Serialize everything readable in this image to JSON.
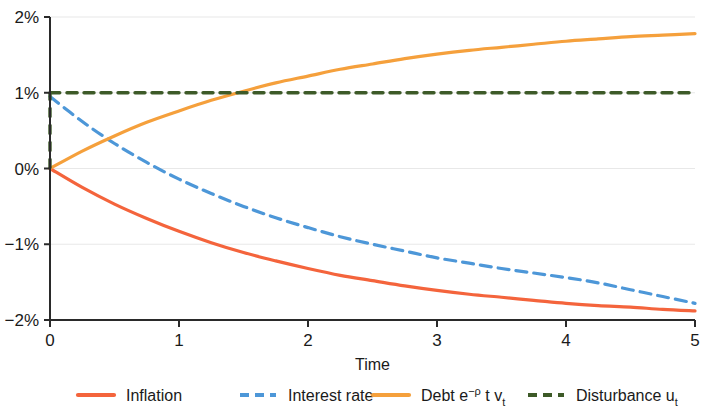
{
  "chart_data": {
    "type": "line",
    "title": "",
    "xlabel": "Time",
    "ylabel": "",
    "xlim": [
      0,
      5
    ],
    "ylim": [
      -2,
      2
    ],
    "grid": true,
    "legend_position": "bottom",
    "x_ticks": [
      "0",
      "1",
      "2",
      "3",
      "4",
      "5"
    ],
    "x_tick_values": [
      0,
      1,
      2,
      3,
      4,
      5
    ],
    "y_ticks": [
      "2%",
      "1%",
      "0%",
      "−1%",
      "−2%"
    ],
    "y_tick_values": [
      2,
      1,
      0,
      -1,
      -2
    ],
    "x": [
      0,
      0.25,
      0.5,
      0.75,
      1,
      1.25,
      1.5,
      1.75,
      2,
      2.25,
      2.5,
      2.75,
      3,
      3.25,
      3.5,
      3.75,
      4,
      4.25,
      4.5,
      4.75,
      5
    ],
    "series": [
      {
        "name": "Inflation",
        "label": "Inflation",
        "color": "#F4643C",
        "style": "solid",
        "width": 3.2,
        "values": [
          0.0,
          -0.25,
          -0.47,
          -0.66,
          -0.83,
          -0.98,
          -1.11,
          -1.22,
          -1.32,
          -1.41,
          -1.48,
          -1.55,
          -1.61,
          -1.66,
          -1.7,
          -1.74,
          -1.78,
          -1.81,
          -1.83,
          -1.86,
          -1.88
        ]
      },
      {
        "name": "Interest rate",
        "label": "Interest rate",
        "color": "#4D97D8",
        "style": "dashed",
        "width": 3.2,
        "dash": "11,7",
        "values": [
          0.95,
          0.62,
          0.33,
          0.08,
          -0.14,
          -0.33,
          -0.5,
          -0.65,
          -0.78,
          -0.9,
          -1.0,
          -1.09,
          -1.18,
          -1.25,
          -1.32,
          -1.38,
          -1.44,
          -1.51,
          -1.6,
          -1.69,
          -1.78
        ]
      },
      {
        "name": "Debt",
        "label": "Debt e−ρ t v_t",
        "label_prefix": "Debt e",
        "label_sup": "−ρ",
        "label_mid": "t",
        "label_var": "v",
        "label_sub": "t",
        "color": "#F5A03C",
        "style": "solid",
        "width": 3.2,
        "values": [
          0.0,
          0.23,
          0.43,
          0.61,
          0.76,
          0.9,
          1.02,
          1.13,
          1.22,
          1.31,
          1.38,
          1.45,
          1.51,
          1.56,
          1.6,
          1.64,
          1.68,
          1.71,
          1.74,
          1.76,
          1.78
        ]
      },
      {
        "name": "Disturbance",
        "label": "Disturbance u_t",
        "label_prefix": "Disturbance u",
        "label_sub": "t",
        "color": "#3D5A28",
        "style": "dashed",
        "width": 3.4,
        "dash": "10,7",
        "values": [
          1.0,
          1.0,
          1.0,
          1.0,
          1.0,
          1.0,
          1.0,
          1.0,
          1.0,
          1.0,
          1.0,
          1.0,
          1.0,
          1.0,
          1.0,
          1.0,
          1.0,
          1.0,
          1.0,
          1.0,
          1.0
        ],
        "has_drop_at_origin": true,
        "drop_from": 1.0,
        "drop_to": 0.0
      }
    ],
    "legend_entries": [
      {
        "label": "Inflation",
        "color": "#F4643C",
        "style": "solid"
      },
      {
        "label": "Interest rate",
        "color": "#4D97D8",
        "style": "dashed"
      },
      {
        "label": "Debt",
        "color": "#F5A03C",
        "style": "solid"
      },
      {
        "label": "Disturbance",
        "color": "#3D5A28",
        "style": "dashed"
      }
    ]
  },
  "axes": {
    "x_title": "Time"
  }
}
